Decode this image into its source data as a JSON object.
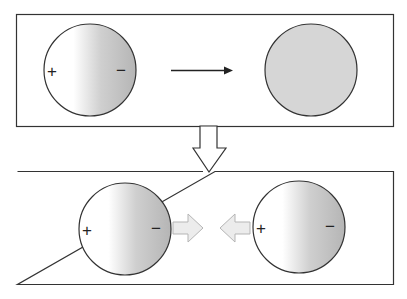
{
  "diagram": {
    "colors": {
      "stroke": "#333333",
      "neutral_fill": "#d6d6d6",
      "gradient_light": "#ffffff",
      "gradient_dark": "#b8b8b8",
      "hollow_arrow_fill": "#ffffff",
      "small_arrow_fill": "#ececec",
      "small_arrow_stroke": "#b5b5b5"
    },
    "top_panel": {
      "left_sphere": {
        "plus_label": "+",
        "minus_label": "−",
        "type": "polarized"
      },
      "arrow": "right-arrow",
      "right_sphere": {
        "type": "neutral"
      }
    },
    "transition_arrow": "hollow-down-arrow",
    "bottom_panel": {
      "left_sphere": {
        "plus_label": "+",
        "minus_label": "−",
        "type": "polarized"
      },
      "attract_arrows": [
        "right-hollow-arrow",
        "left-hollow-arrow"
      ],
      "right_sphere": {
        "plus_label": "+",
        "minus_label": "−",
        "type": "polarized"
      }
    }
  }
}
